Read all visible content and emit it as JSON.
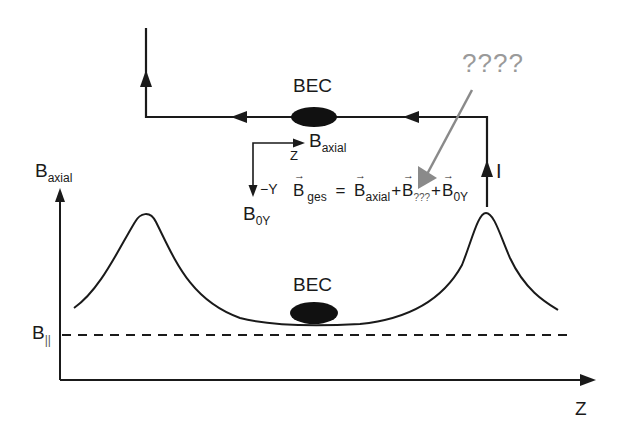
{
  "diagram": {
    "circuit": {
      "bec_label": "BEC",
      "current_label": "I",
      "unknown_label": "????"
    },
    "axes_legend": {
      "z_label": "Z",
      "neg_y_label": "−Y",
      "b_axial": {
        "base": "B",
        "sub": "axial"
      },
      "b_0y": {
        "base": "B",
        "sub": "0Y"
      }
    },
    "equation": {
      "lhs": {
        "base": "B",
        "sub": "ges"
      },
      "equals": "=",
      "terms": [
        {
          "base": "B",
          "sub": "axial"
        },
        {
          "base": "B",
          "sub": "???"
        },
        {
          "base": "B",
          "sub": "0Y"
        }
      ],
      "plus": "+"
    },
    "plot": {
      "y_axis": {
        "base": "B",
        "sub": "axial"
      },
      "x_axis": "Z",
      "baseline": {
        "base": "B",
        "sub": "||"
      },
      "bec_label": "BEC"
    },
    "colors": {
      "line": "#1a1a1a",
      "unknown_arrow": "#8a8a8a",
      "text": "#1a1a1a"
    }
  }
}
